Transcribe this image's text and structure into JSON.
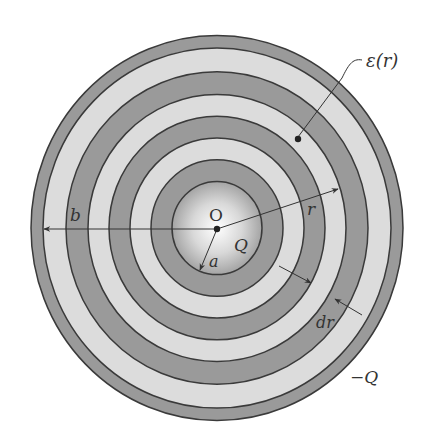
{
  "diagram": {
    "colors": {
      "dark_band": "#9a9a9a",
      "light_band": "#dcdcdc",
      "ring_line": "#3a3a3a",
      "core_center": "#ffffff",
      "core_edge": "#a8a8a8"
    },
    "labels": {
      "permittivity": "ε(r)",
      "center": "O",
      "inner_charge": "Q",
      "inner_radius": "a",
      "outer_radius": "b",
      "radius": "r",
      "thickness": "dr",
      "outer_charge": "−Q"
    }
  }
}
